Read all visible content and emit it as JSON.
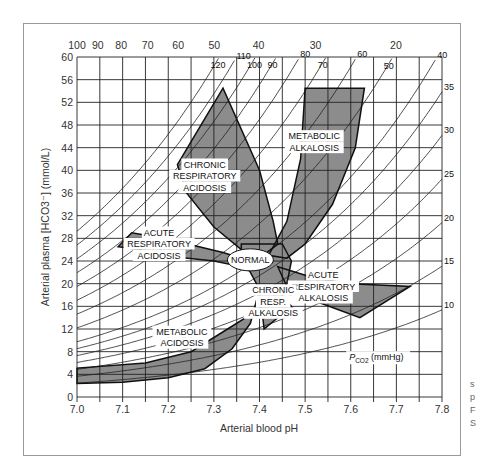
{
  "chart_data": {
    "type": "line",
    "title": "",
    "xlabel": "Arterial blood pH",
    "ylabel": "Arterial plasma [HCO3-] (mmol/L)",
    "xlim": [
      7.0,
      7.8
    ],
    "ylim": [
      0,
      60
    ],
    "x_ticks": [
      "7.0",
      "7.1",
      "7.2",
      "7.3",
      "7.4",
      "7.5",
      "7.6",
      "7.7",
      "7.8"
    ],
    "y_ticks": [
      "0",
      "4",
      "8",
      "12",
      "16",
      "20",
      "24",
      "28",
      "32",
      "36",
      "40",
      "44",
      "48",
      "52",
      "56",
      "60"
    ],
    "top_axis_ticks_H_nmol": [
      "100",
      "90",
      "80",
      "70",
      "60",
      "50",
      "40",
      "30",
      "20"
    ],
    "isobar_label": "PCO2 (mmHg)",
    "isobars_pco2": [
      10,
      15,
      20,
      25,
      30,
      35,
      40,
      50,
      60,
      70,
      80,
      90,
      100,
      110,
      120
    ],
    "grid": true,
    "regions": [
      {
        "name": "NORMAL",
        "label": "NORMAL"
      },
      {
        "name": "chronic-respiratory-acidosis",
        "label": [
          "CHRONIC",
          "RESPIRATORY",
          "ACIDOSIS"
        ]
      },
      {
        "name": "metabolic-alkalosis",
        "label": [
          "METABOLIC",
          "ALKALOSIS"
        ]
      },
      {
        "name": "acute-respiratory-acidosis",
        "label": [
          "ACUTE",
          "RESPIRATORY",
          "ACIDOSIS"
        ]
      },
      {
        "name": "acute-respiratory-alkalosis",
        "label": [
          "ACUTE",
          "RESPIRATORY",
          "ALKALOSIS"
        ]
      },
      {
        "name": "chronic-resp-alkalosis",
        "label": [
          "CHRONIC",
          "RESP.",
          "ALKALOSIS"
        ]
      },
      {
        "name": "metabolic-acidosis",
        "label": [
          "METABOLIC",
          "ACIDOSIS"
        ]
      }
    ]
  },
  "labels": {
    "xlabel": "Arterial blood pH",
    "ylabel": "Arterial plasma [HCO3⁻] (mmol/L)",
    "pco2_label": "P",
    "pco2_sub": "CO2",
    "pco2_unit": " (mmHg)",
    "normal": "NORMAL",
    "cra": [
      "CHRONIC",
      "RESPIRATORY",
      "ACIDOSIS"
    ],
    "malk": [
      "METABOLIC",
      "ALKALOSIS"
    ],
    "ara": [
      "ACUTE",
      "RESPIRATORY",
      "ACIDOSIS"
    ],
    "aralk": [
      "ACUTE",
      "RESPIRATORY",
      "ALKALOSIS"
    ],
    "cralk": [
      "CHRONIC",
      "RESP.",
      "ALKALOSIS"
    ],
    "macid": [
      "METABOLIC",
      "ACIDOSIS"
    ]
  },
  "side_note": [
    "s",
    "p",
    "F",
    "S"
  ],
  "colors": {
    "region_fill": "#8c8c8c",
    "region_stroke": "#111111",
    "grid": "#222222",
    "isobar": "#222222"
  }
}
